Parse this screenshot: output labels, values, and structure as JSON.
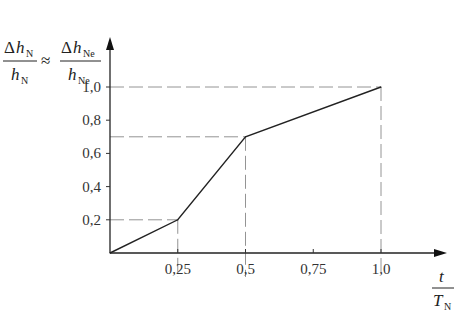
{
  "chart_data": {
    "type": "line",
    "title": "",
    "xlabel": {
      "numerator": "t",
      "denominator_main": "T",
      "denominator_sub": "N"
    },
    "ylabel": {
      "left": {
        "num_delta": "Δ",
        "num_main": "h",
        "num_sub": "N",
        "den_main": "h",
        "den_sub": "N"
      },
      "approx": "≈",
      "right": {
        "num_delta": "Δ",
        "num_main": "h",
        "num_sub": "Ne",
        "den_main": "h",
        "den_sub": "Ne"
      }
    },
    "xlim": [
      0,
      1.25
    ],
    "ylim": [
      0,
      1.1
    ],
    "xticks": [
      {
        "value": 0.25,
        "label": "0,25"
      },
      {
        "value": 0.5,
        "label": "0,5"
      },
      {
        "value": 0.75,
        "label": "0,75"
      },
      {
        "value": 1.0,
        "label": "1,0"
      }
    ],
    "yticks": [
      {
        "value": 0.2,
        "label": "0,2"
      },
      {
        "value": 0.4,
        "label": "0,4"
      },
      {
        "value": 0.6,
        "label": "0,6"
      },
      {
        "value": 0.8,
        "label": "0,8"
      },
      {
        "value": 1.0,
        "label": "1,0"
      }
    ],
    "series": [
      {
        "name": "relative head loss",
        "x": [
          0,
          0.25,
          0.5,
          1.0
        ],
        "y": [
          0,
          0.2,
          0.7,
          1.0
        ]
      }
    ],
    "guides": [
      {
        "x": 0.25,
        "y": 0.2
      },
      {
        "x": 0.5,
        "y": 0.7
      },
      {
        "x": 1.0,
        "y": 1.0
      }
    ],
    "grid": false,
    "legend": "none"
  }
}
